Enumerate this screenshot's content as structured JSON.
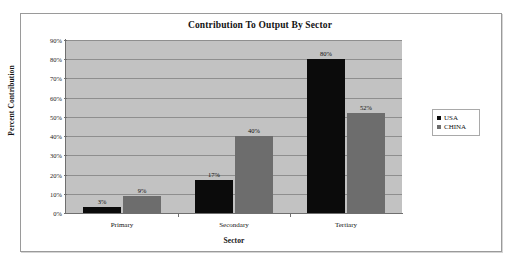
{
  "figure": {
    "title": "Contribution To Output By Sector"
  },
  "chart_data": {
    "type": "bar",
    "title": "Contribution To Output By Sector",
    "xlabel": "Sector",
    "ylabel": "Percent Contribution",
    "categories": [
      "Primary",
      "Secondary",
      "Tertiary"
    ],
    "series": [
      {
        "name": "USA",
        "color": "#0b0b0b",
        "values": [
          3,
          17,
          80
        ],
        "labels": [
          "3%",
          "17%",
          "80%"
        ]
      },
      {
        "name": "CHINA",
        "color": "#6d6d6d",
        "values": [
          9,
          40,
          52
        ],
        "labels": [
          "9%",
          "40%",
          "52%"
        ]
      }
    ],
    "ylim": [
      0,
      90
    ],
    "ytick_values": [
      0,
      10,
      20,
      30,
      40,
      50,
      60,
      70,
      80,
      90
    ],
    "ytick_labels": [
      "0%",
      "10%",
      "20%",
      "30%",
      "40%",
      "50%",
      "60%",
      "70%",
      "80%",
      "90%"
    ],
    "grid": true,
    "legend_position": "right",
    "plot_background": "#c2c2c2"
  }
}
